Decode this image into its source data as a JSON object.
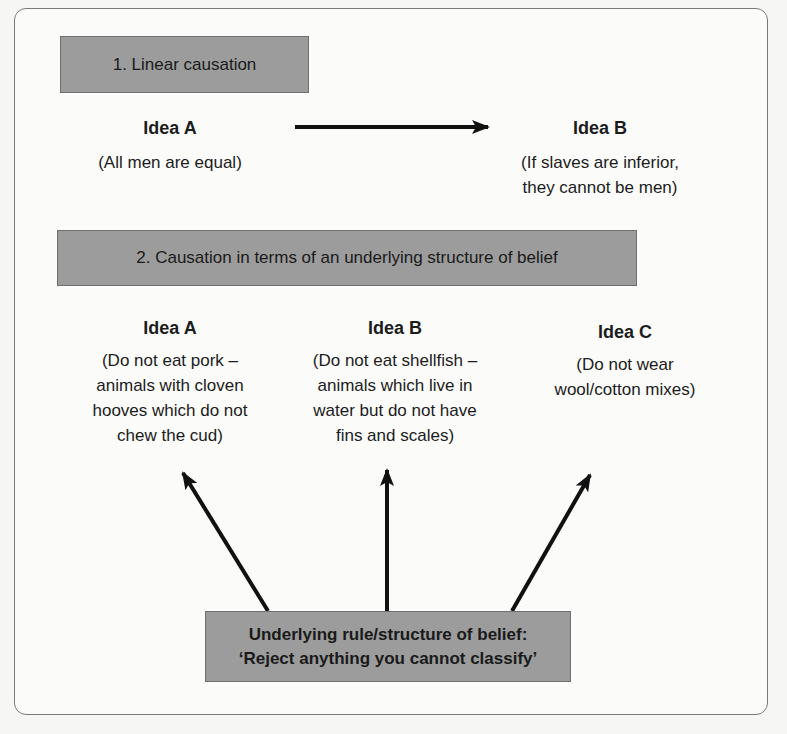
{
  "section1": {
    "header": "1. Linear causation",
    "idea_a": {
      "title": "Idea A",
      "desc": "(All men are equal)"
    },
    "idea_b": {
      "title": "Idea B",
      "desc_line1": "(If slaves are inferior,",
      "desc_line2": "they cannot be men)"
    }
  },
  "section2": {
    "header": "2. Causation in terms of an underlying structure of belief",
    "ideas": [
      {
        "title": "Idea A",
        "lines": [
          "(Do not eat pork –",
          "animals with cloven",
          "hooves which do not",
          "chew the cud)"
        ]
      },
      {
        "title": "Idea B",
        "lines": [
          "(Do not eat shellfish –",
          "animals which live in",
          "water but do not have",
          "fins and scales)"
        ]
      },
      {
        "title": "Idea C",
        "lines": [
          "(Do not wear",
          "wool/cotton mixes)"
        ]
      }
    ],
    "rule": {
      "line1": "Underlying rule/structure of belief:",
      "line2": "‘Reject anything you cannot classify’"
    }
  },
  "colors": {
    "box_fill": "#9c9c9c",
    "arrow": "#111111",
    "frame": "#7a7a7a"
  }
}
